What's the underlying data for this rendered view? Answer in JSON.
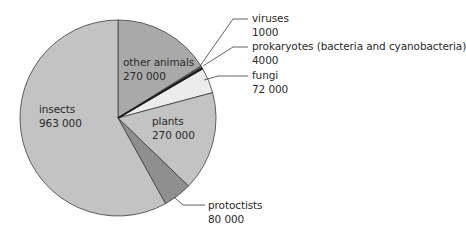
{
  "chart_data": {
    "type": "pie",
    "title": "",
    "units": "number of species",
    "total": 1930000,
    "start_angle_deg": 0,
    "direction": "clockwise",
    "slices": [
      {
        "name": "other animals",
        "value": 270000,
        "value_label": "270 000",
        "color": "#a9a9a9",
        "start": 0,
        "end": 58
      },
      {
        "name": "viruses",
        "value": 1000,
        "value_label": "1000",
        "color": "#6e6e6e",
        "start": 58,
        "end": 59
      },
      {
        "name": "prokaryotes (bacteria and cyanobacteria)",
        "value": 4000,
        "value_label": "4000",
        "color": "#1e1e1e",
        "start": 59,
        "end": 60
      },
      {
        "name": "fungi",
        "value": 72000,
        "value_label": "72 000",
        "color": "#ececec",
        "start": 60,
        "end": 75
      },
      {
        "name": "plants",
        "value": 270000,
        "value_label": "270 000",
        "color": "#c3c3c3",
        "start": 75,
        "end": 134
      },
      {
        "name": "protoctists",
        "value": 80000,
        "value_label": "80 000",
        "color": "#8f8f8f",
        "start": 134,
        "end": 151
      },
      {
        "name": "insects",
        "value": 963000,
        "value_label": "963 000",
        "color": "#c3c3c3",
        "start": 151,
        "end": 360
      }
    ],
    "labels_inside": [
      "other animals",
      "plants",
      "insects"
    ],
    "labels_outside": [
      "viruses",
      "prokaryotes (bacteria and cyanobacteria)",
      "fungi",
      "protoctists"
    ],
    "legend": "none"
  },
  "labels": {
    "other_animals": {
      "name": "other animals",
      "value": "270 000"
    },
    "insects": {
      "name": "insects",
      "value": "963 000"
    },
    "plants": {
      "name": "plants",
      "value": "270 000"
    },
    "viruses": {
      "name": "viruses",
      "value": "1000"
    },
    "prokaryotes": {
      "name": "prokaryotes (bacteria and cyanobacteria)",
      "value": "4000"
    },
    "fungi": {
      "name": "fungi",
      "value": "72 000"
    },
    "protoctists": {
      "name": "protoctists",
      "value": "80 000"
    }
  },
  "geometry": {
    "cx": 118,
    "cy": 118,
    "r": 98
  }
}
